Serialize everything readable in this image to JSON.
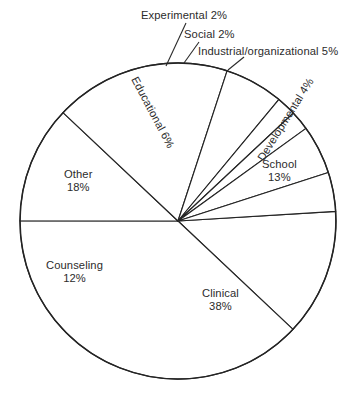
{
  "chart_data": {
    "type": "pie",
    "title": "",
    "subtitle": "",
    "xlabel": "",
    "ylabel": "",
    "legend_position": "none",
    "grid": false,
    "units": "percent",
    "total": 100,
    "categories": [
      "Clinical",
      "Other",
      "School",
      "Counseling",
      "Educational",
      "Industrial/organizational",
      "Developmental",
      "Experimental",
      "Social"
    ],
    "values": [
      38,
      18,
      13,
      12,
      6,
      5,
      4,
      2,
      2
    ],
    "slices": [
      {
        "name": "school",
        "label": "School",
        "value_label": "13%",
        "value": 13,
        "label_style": "inside-two-line",
        "label_x": 262,
        "label_y": 158,
        "rotation": 0
      },
      {
        "name": "clinical",
        "label": "Clinical",
        "value_label": "38%",
        "value": 38,
        "label_style": "inside-two-line",
        "label_x": 202,
        "label_y": 287,
        "rotation": 0
      },
      {
        "name": "counseling",
        "label": "Counseling",
        "value_label": "12%",
        "value": 12,
        "label_style": "inside-two-line",
        "label_x": 46,
        "label_y": 259,
        "rotation": 0
      },
      {
        "name": "other",
        "label": "Other",
        "value_label": "18%",
        "value": 18,
        "label_style": "inside-two-line",
        "label_x": 64,
        "label_y": 168,
        "rotation": 0
      },
      {
        "name": "educational",
        "label": "Educational",
        "value_label": "6%",
        "value": 6,
        "label_style": "inside-rotated",
        "label_x": 113,
        "label_y": 106,
        "rotation": 62
      },
      {
        "name": "experimental",
        "label": "Experimental",
        "value_label": "2%",
        "value": 2,
        "label_style": "leader-outside",
        "label_x": 141,
        "label_y": 9,
        "leader": [
          [
            166,
            66
          ],
          [
            186,
            23
          ]
        ]
      },
      {
        "name": "social",
        "label": "Social",
        "value_label": "2%",
        "value": 2,
        "label_style": "leader-outside",
        "label_x": 184,
        "label_y": 28,
        "leader": [
          [
            184,
            63
          ],
          [
            199,
            42
          ]
        ]
      },
      {
        "name": "industrial-organizational",
        "label": "Industrial/organizational",
        "value_label": "5%",
        "value": 5,
        "label_style": "leader-outside",
        "label_x": 198,
        "label_y": 45,
        "leader": [
          [
            228,
            70
          ],
          [
            244,
            57
          ]
        ]
      },
      {
        "name": "developmental",
        "label": "Developmental",
        "value_label": "4%",
        "value": 4,
        "label_style": "inside-rotated",
        "label_x": 238,
        "label_y": 113,
        "rotation": -58
      }
    ],
    "geometry": {
      "center_x": 178,
      "center_y": 221,
      "radius": 158,
      "start_angle_deg": -3.5,
      "direction": "clockwise"
    },
    "colors": {
      "slice_fill": "#ffffff",
      "slice_stroke": "#242424",
      "text": "#2c2c2c",
      "background": "#ffffff"
    }
  }
}
